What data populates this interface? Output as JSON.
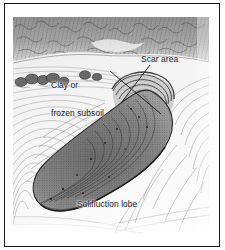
{
  "figure": {
    "caption_present": false,
    "frame_color": "#18181a",
    "ink_color": "#1d1d1f",
    "paper_color": "#ffffff",
    "illustration_tone": "#f3f3f3",
    "medium": "pen-and-ink landscape diagram"
  },
  "labels": {
    "clay": "Clay or\nfrozen subsoil",
    "clay_line1": "Clay or",
    "clay_line2": "frozen subsoil",
    "scar": "Scar area",
    "lobe": "Solifluction lobe"
  },
  "leaders": [
    {
      "name": "clay-or-frozen-subsoil-leader",
      "from_label": "Clay or frozen subsoil",
      "x1": 97,
      "y1": 54,
      "x2": 148,
      "y2": 97
    },
    {
      "name": "scar-area-leader",
      "from_label": "Scar area",
      "x1": 137,
      "y1": 48,
      "x2": 108,
      "y2": 86
    }
  ],
  "scene_elements": [
    "distant dark hillside band across top",
    "row of low bushes on left mid-slope",
    "arcuate scar (scarp) with concentric ridges",
    "tongue-shaped solifluction lobe in centre",
    "hachured slope lines radiating downhill"
  ]
}
